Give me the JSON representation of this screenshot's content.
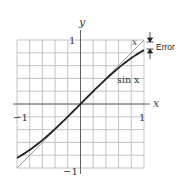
{
  "chart_data": {
    "type": "line",
    "title": "",
    "xlabel": "x",
    "ylabel": "y",
    "xlim": [
      -1,
      1
    ],
    "ylim": [
      -1,
      1
    ],
    "grid": true,
    "grid_divisions": 10,
    "x_tick_labels": [
      "-1",
      "1"
    ],
    "y_tick_labels": [
      "1",
      "-1"
    ],
    "series": [
      {
        "name": "x",
        "label": "x",
        "color": "#999999",
        "x": [
          -1,
          -0.5,
          0,
          0.5,
          1
        ],
        "values": [
          -1,
          -0.5,
          0,
          0.5,
          1
        ]
      },
      {
        "name": "sin x",
        "label": "sin x",
        "color": "#222222",
        "x": [
          -1,
          -0.8,
          -0.6,
          -0.4,
          -0.2,
          0,
          0.2,
          0.4,
          0.6,
          0.8,
          1
        ],
        "values": [
          -0.841,
          -0.717,
          -0.565,
          -0.389,
          -0.199,
          0,
          0.199,
          0.389,
          0.565,
          0.717,
          0.841
        ]
      }
    ],
    "annotations": [
      {
        "text": "Error",
        "description": "vertical gap between x and sin x at x = 1, marked with arrows"
      }
    ]
  },
  "labels": {
    "y_axis": "y",
    "x_axis": "x",
    "y_top": "1",
    "y_bottom": "−1",
    "x_left": "−1",
    "x_right": "1",
    "line_x": "x",
    "line_sin": "sin x",
    "error": "Error"
  },
  "colors": {
    "grid": "#b5b5b5",
    "axis": "#555555",
    "line_x": "#9a9a9a",
    "line_sin": "#222222"
  }
}
